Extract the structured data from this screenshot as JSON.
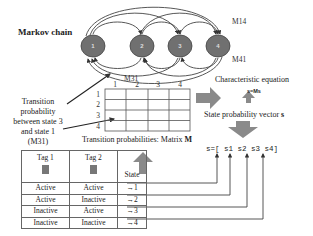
{
  "title": "Markov chain",
  "chain": {
    "nodes": [
      "1",
      "2",
      "3",
      "4"
    ],
    "node_color": "#707070",
    "edge_labels": {
      "m14": "M14",
      "m41": "M41",
      "m31": "M31"
    }
  },
  "transition_note": {
    "lines": [
      "Transition",
      "probability",
      "between state 3",
      "and state 1",
      "(M31)"
    ]
  },
  "matrix": {
    "col_headers": [
      "1",
      "2",
      "3",
      "4"
    ],
    "row_headers": [
      "1",
      "2",
      "3",
      "4"
    ],
    "caption_prefix": "Transition probabilities: Matrix ",
    "caption_symbol": "M"
  },
  "char_eq": {
    "label": "Characteristic equation",
    "formula": "s=Ms"
  },
  "state_vector": {
    "label_prefix": "State probability vector ",
    "label_symbol": "s",
    "expression": "s=[ s1  s2  s3  s4]"
  },
  "state_table": {
    "headers": [
      "Tag 1",
      "Tag 2",
      "State"
    ],
    "rows": [
      {
        "tag1": "Active",
        "tag2": "Active",
        "state": "1"
      },
      {
        "tag1": "Active",
        "tag2": "Inactive",
        "state": "2"
      },
      {
        "tag1": "Inactive",
        "tag2": "Active",
        "state": "3"
      },
      {
        "tag1": "Inactive",
        "tag2": "Inactive",
        "state": "4"
      }
    ],
    "arrow_glyph": "→"
  },
  "colors": {
    "block_arrow": "#8a8a8a",
    "line": "#333333",
    "tag_box": "#777777"
  }
}
